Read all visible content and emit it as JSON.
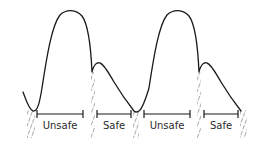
{
  "diagram": {
    "type": "pressure-waveform-timing",
    "stroke_color": "#1a1a1a",
    "hatch_color": "#555555",
    "labels": {
      "cycle1_unsafe": "Unsafe",
      "cycle1_safe": "Safe",
      "cycle2_unsafe": "Unsafe",
      "cycle2_safe": "Safe"
    },
    "cycles": [
      {
        "systolic_peak": [
          70,
          12
        ],
        "dicrotic_notch": [
          92,
          72
        ],
        "secondary_peak": [
          100,
          63
        ],
        "end_diastole": [
          134,
          112
        ],
        "unsafe_bracket": [
          37,
          83
        ],
        "safe_bracket": [
          96,
          131
        ]
      },
      {
        "systolic_peak": [
          177,
          12
        ],
        "dicrotic_notch": [
          199,
          72
        ],
        "secondary_peak": [
          207,
          63
        ],
        "end_diastole": [
          241,
          112
        ],
        "unsafe_bracket": [
          144,
          190
        ],
        "safe_bracket": [
          203,
          238
        ]
      }
    ],
    "hatched_markers_x": [
      31,
      93,
      136,
      199,
      244
    ]
  }
}
